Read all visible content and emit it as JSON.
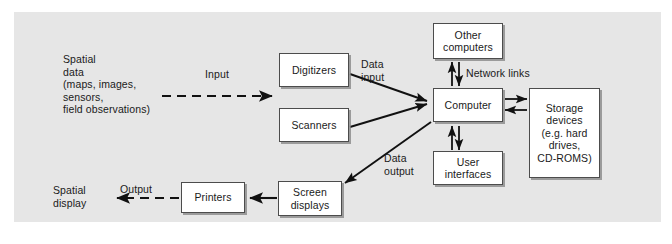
{
  "diagram": {
    "background_color": "#e6e6e6",
    "box_fill": "#ffffff",
    "box_border": "#4c4c4c",
    "line_color": "#111111",
    "text_color": "#1a1a1a"
  },
  "nodes": [
    {
      "id": "digitizers",
      "label": "Digitizers"
    },
    {
      "id": "scanners",
      "label": "Scanners"
    },
    {
      "id": "other_computers",
      "label": "Other\ncomputers"
    },
    {
      "id": "computer",
      "label": "Computer"
    },
    {
      "id": "storage_devices",
      "label": "Storage\ndevices\n(e.g. hard\ndrives,\nCD-ROMS)"
    },
    {
      "id": "user_interfaces",
      "label": "User\ninterfaces"
    },
    {
      "id": "screen_displays",
      "label": "Screen\ndisplays"
    },
    {
      "id": "printers",
      "label": "Printers"
    }
  ],
  "labels": {
    "spatial_data": "Spatial\ndata\n(maps, images,\nsensors,\nfield observations)",
    "input": "Input",
    "data_input": "Data\ninput",
    "network_links": "Network links",
    "data_output": "Data\noutput",
    "output": "Output",
    "spatial_display": "Spatial\ndisplay"
  },
  "edges": [
    {
      "id": "spatial-data-to-digitizers",
      "from": "spatial data",
      "to": "digitizers",
      "label": "Input",
      "style": "dashed",
      "arrow": "single"
    },
    {
      "id": "digitizers-to-computer",
      "from": "digitizers",
      "to": "computer",
      "label": "Data input",
      "style": "solid",
      "arrow": "single"
    },
    {
      "id": "scanners-to-computer",
      "from": "scanners",
      "to": "computer",
      "label": "Data input",
      "style": "solid",
      "arrow": "single"
    },
    {
      "id": "computer-to-other-computers",
      "from": "computer",
      "to": "other computers",
      "label": "Network links",
      "style": "solid",
      "arrow": "double"
    },
    {
      "id": "computer-to-storage-devices",
      "from": "computer",
      "to": "storage devices",
      "label": "",
      "style": "solid",
      "arrow": "double"
    },
    {
      "id": "computer-to-user-interfaces",
      "from": "computer",
      "to": "user interfaces",
      "label": "",
      "style": "solid",
      "arrow": "double"
    },
    {
      "id": "computer-to-screen-displays",
      "from": "computer",
      "to": "screen displays",
      "label": "Data output",
      "style": "solid",
      "arrow": "single"
    },
    {
      "id": "screen-displays-to-printers",
      "from": "screen displays",
      "to": "printers",
      "label": "",
      "style": "solid",
      "arrow": "single"
    },
    {
      "id": "printers-to-spatial-display",
      "from": "printers",
      "to": "spatial display",
      "label": "Output",
      "style": "dashed",
      "arrow": "single"
    }
  ]
}
